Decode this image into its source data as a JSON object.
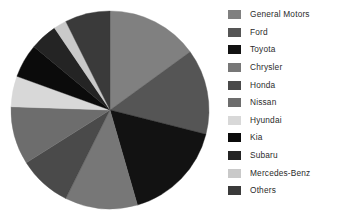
{
  "chart_data": {
    "type": "pie",
    "title": "",
    "legend_position": "right",
    "categories": [
      "General Motors",
      "Ford",
      "Toyota",
      "Chrysler",
      "Honda",
      "Nissan",
      "Hyundai",
      "Kia",
      "Subaru",
      "Mercedes-Benz",
      "Others"
    ],
    "values": [
      15.8,
      14.7,
      17.5,
      12.5,
      9.2,
      10.0,
      5.3,
      5.8,
      4.7,
      2.2,
      7.8
    ],
    "unit": "percent",
    "start_angle_deg": 0,
    "direction": "clockwise",
    "slices": [
      {
        "label": "General Motors",
        "value": 15.8,
        "angle_deg": 57,
        "color": "#808080"
      },
      {
        "label": "Ford",
        "value": 14.7,
        "angle_deg": 53,
        "color": "#555555"
      },
      {
        "label": "Toyota",
        "value": 17.5,
        "angle_deg": 63,
        "color": "#121212"
      },
      {
        "label": "Chrysler",
        "value": 12.5,
        "angle_deg": 45,
        "color": "#777777"
      },
      {
        "label": "Honda",
        "value": 9.2,
        "angle_deg": 33,
        "color": "#4a4a4a"
      },
      {
        "label": "Nissan",
        "value": 10.0,
        "angle_deg": 36,
        "color": "#6d6d6d"
      },
      {
        "label": "Hyundai",
        "value": 5.3,
        "angle_deg": 19,
        "color": "#d8d8d8"
      },
      {
        "label": "Kia",
        "value": 5.8,
        "angle_deg": 21,
        "color": "#0b0b0b"
      },
      {
        "label": "Subaru",
        "value": 4.7,
        "angle_deg": 17,
        "color": "#242424"
      },
      {
        "label": "Mercedes-Benz",
        "value": 2.2,
        "angle_deg": 8,
        "color": "#c9c9c9"
      },
      {
        "label": "Others",
        "value": 7.8,
        "angle_deg": 28,
        "color": "#3a3a3a"
      }
    ],
    "geometry": {
      "center_x": 110,
      "center_y": 110,
      "radius": 99
    },
    "background_color": "#ffffff",
    "text_color": "#2b2b2b"
  },
  "legend": {
    "items": [
      {
        "label": "General Motors",
        "color": "#808080"
      },
      {
        "label": "Ford",
        "color": "#555555"
      },
      {
        "label": "Toyota",
        "color": "#121212"
      },
      {
        "label": "Chrysler",
        "color": "#777777"
      },
      {
        "label": "Honda",
        "color": "#4a4a4a"
      },
      {
        "label": "Nissan",
        "color": "#6d6d6d"
      },
      {
        "label": "Hyundai",
        "color": "#d8d8d8"
      },
      {
        "label": "Kia",
        "color": "#0b0b0b"
      },
      {
        "label": "Subaru",
        "color": "#242424"
      },
      {
        "label": "Mercedes-Benz",
        "color": "#c9c9c9"
      },
      {
        "label": "Others",
        "color": "#3a3a3a"
      }
    ]
  }
}
